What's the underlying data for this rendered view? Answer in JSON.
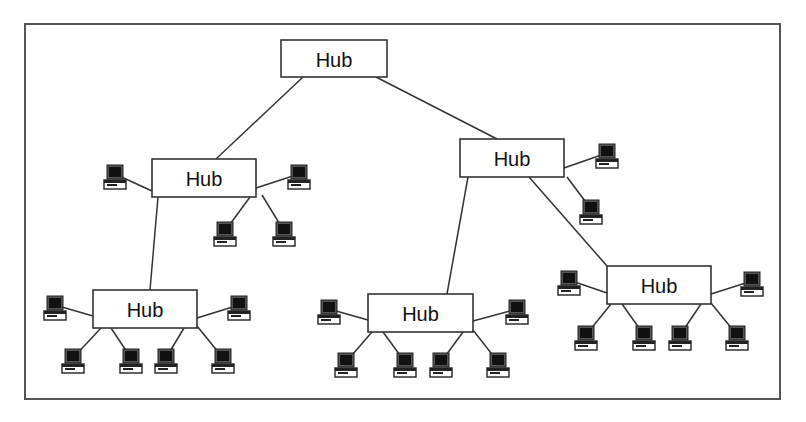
{
  "diagram": {
    "type": "hierarchical-star-network",
    "colors": {
      "line": "#333333",
      "frame": "#555555",
      "screen": "#111111",
      "background": "#ffffff"
    },
    "hubs": [
      {
        "id": "root",
        "label": "Hub",
        "parent": null
      },
      {
        "id": "left",
        "label": "Hub",
        "parent": "root"
      },
      {
        "id": "right",
        "label": "Hub",
        "parent": "root"
      },
      {
        "id": "left-bottom",
        "label": "Hub",
        "parent": "left"
      },
      {
        "id": "right-bottom-left",
        "label": "Hub",
        "parent": "right"
      },
      {
        "id": "right-bottom-right",
        "label": "Hub",
        "parent": "right"
      }
    ],
    "computers": [
      {
        "hub": "left",
        "count": 4
      },
      {
        "hub": "right",
        "count": 2
      },
      {
        "hub": "left-bottom",
        "count": 6
      },
      {
        "hub": "right-bottom-left",
        "count": 6
      },
      {
        "hub": "right-bottom-right",
        "count": 6
      }
    ]
  }
}
